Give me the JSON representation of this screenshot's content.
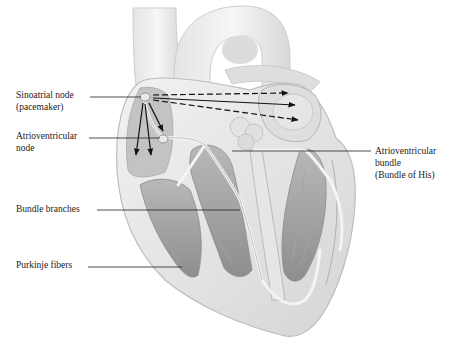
{
  "figure": {
    "colors": {
      "background": "#ffffff",
      "tissue_light": "#ececec",
      "tissue_mid": "#c9c9c9",
      "tissue_dark": "#9a9a9a",
      "line": "#333333",
      "label_text": "#222222"
    }
  },
  "labels": {
    "sa_node": {
      "line1": "Sinoatrial node",
      "line2": "(pacemaker)"
    },
    "av_node": {
      "line1": "Atrioventricular",
      "line2": "node"
    },
    "av_bundle": {
      "line1": "Atrioventricular",
      "line2": "bundle",
      "line3": "(Bundle of His)"
    },
    "bundle_branches": {
      "line1": "Bundle branches"
    },
    "purkinje": {
      "line1": "Purkinje fibers"
    }
  }
}
